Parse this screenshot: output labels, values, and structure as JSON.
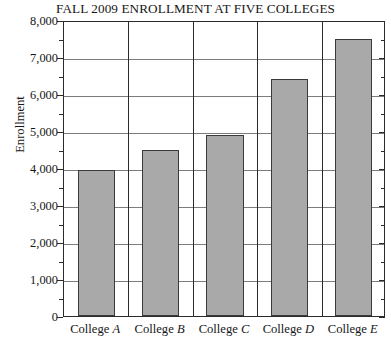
{
  "chart_data": {
    "type": "bar",
    "title": "FALL 2009 ENROLLMENT AT FIVE COLLEGES",
    "xlabel": "",
    "ylabel": "Enrollment",
    "categories": [
      "College A",
      "College B",
      "College C",
      "College D",
      "College E"
    ],
    "category_names": [
      "College",
      "College",
      "College",
      "College",
      "College"
    ],
    "category_letters": [
      "A",
      "B",
      "C",
      "D",
      "E"
    ],
    "values": [
      3950,
      4500,
      4900,
      6400,
      7500
    ],
    "ylim": [
      0,
      8000
    ],
    "ytick_step": 1000,
    "yminor_step": 500,
    "ytick_labels": [
      "0",
      "1,000",
      "2,000",
      "3,000",
      "4,000",
      "5,000",
      "6,000",
      "7,000",
      "8,000"
    ],
    "ytick_values": [
      0,
      1000,
      2000,
      3000,
      4000,
      5000,
      6000,
      7000,
      8000
    ],
    "grid": true,
    "legend": "none",
    "bar_color": "#a9a9a9",
    "bar_edge_color": "#3a3a3a",
    "axis_color": "#2b2b2b",
    "grid_color": "#7c7c7c"
  }
}
